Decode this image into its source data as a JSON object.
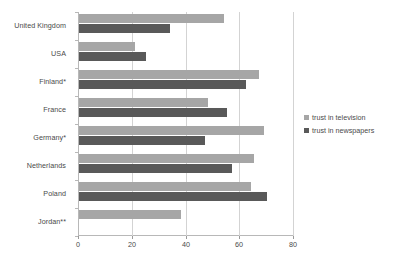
{
  "chart_data": {
    "type": "bar",
    "orientation": "horizontal",
    "title": "",
    "subtitle": "",
    "xlabel": "",
    "ylabel": "",
    "xlim": [
      0,
      80
    ],
    "xticks": [
      0,
      20,
      40,
      60,
      80
    ],
    "xtick_labels": [
      "0",
      "20",
      "40",
      "60",
      "80"
    ],
    "grid": true,
    "grid_axis": "x",
    "legend_position": "right",
    "categories": [
      "United Kingdom",
      "USA",
      "Finland*",
      "France",
      "Germany*",
      "Netherlands",
      "Poland",
      "Jordan**"
    ],
    "series": [
      {
        "name": "trust in television",
        "color": "#a6a6a6",
        "values": [
          54,
          21,
          67,
          48,
          69,
          65,
          64,
          38
        ]
      },
      {
        "name": "trust in newspapers",
        "color": "#595959",
        "values": [
          34,
          25,
          62,
          55,
          47,
          57,
          70,
          null
        ]
      }
    ]
  },
  "legend": {
    "items": [
      {
        "label": "trust in television",
        "color": "#a6a6a6"
      },
      {
        "label": "trust in newspapers",
        "color": "#595959"
      }
    ]
  },
  "colors": {
    "television": "#a6a6a6",
    "newspapers": "#595959",
    "axis": "#b8b8b8",
    "grid": "#d3d3d3",
    "text": "#4a4a4a",
    "background": "#ffffff"
  }
}
